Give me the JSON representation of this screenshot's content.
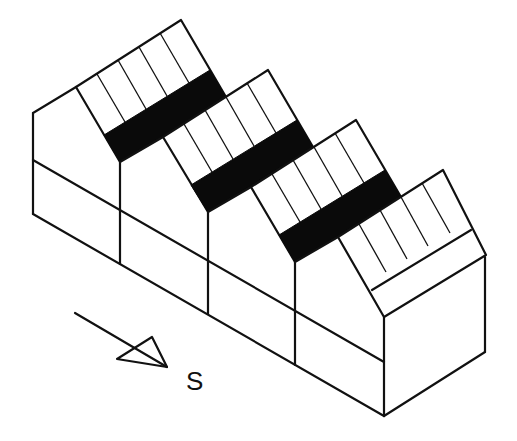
{
  "diagram": {
    "bays": 4,
    "panels_per_bay": 5,
    "compass": {
      "direction_label": "S",
      "icon": "south-arrow-icon"
    },
    "colors": {
      "line": "#111111",
      "band": "#0a0a0a",
      "background": "#ffffff"
    }
  }
}
